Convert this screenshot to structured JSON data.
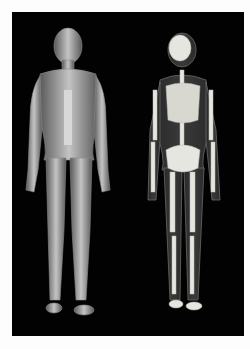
{
  "image": {
    "description": "Anatomical illustration: muscular system figure (left) and skeletal system figure (right) on black background",
    "background_color": "#020202",
    "border_color": "#fdfdfd",
    "figures": [
      {
        "name": "muscular-figure",
        "position": "left",
        "tone": "#b8b8b8"
      },
      {
        "name": "skeletal-figure",
        "position": "right",
        "tone": "#e6e6e0"
      }
    ]
  }
}
